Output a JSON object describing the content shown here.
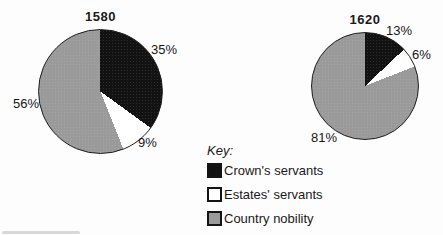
{
  "figure": {
    "background": "#fdfdfd",
    "key": {
      "title": "Key:",
      "items": [
        {
          "label": "Crown's servants",
          "color": "#121212"
        },
        {
          "label": "Estates' servants",
          "color": "#ffffff"
        },
        {
          "label": "Country nobility",
          "color": "#9a9a9a"
        }
      ]
    }
  },
  "chart_data": [
    {
      "type": "pie",
      "title": "1580",
      "categories": [
        "Crown's servants",
        "Estates' servants",
        "Country nobility"
      ],
      "values": [
        35,
        9,
        56
      ],
      "labels": [
        "35%",
        "9%",
        "56%"
      ],
      "colors": [
        "#121212",
        "#ffffff",
        "#9a9a9a"
      ],
      "start_angle_deg": 0,
      "direction": "clockwise",
      "legend_position": "bottom-center-shared"
    },
    {
      "type": "pie",
      "title": "1620",
      "categories": [
        "Crown's servants",
        "Estates' servants",
        "Country nobility"
      ],
      "values": [
        13,
        6,
        81
      ],
      "labels": [
        "13%",
        "6%",
        "81%"
      ],
      "colors": [
        "#121212",
        "#ffffff",
        "#9a9a9a"
      ],
      "start_angle_deg": 0,
      "direction": "clockwise",
      "legend_position": "bottom-center-shared"
    }
  ]
}
